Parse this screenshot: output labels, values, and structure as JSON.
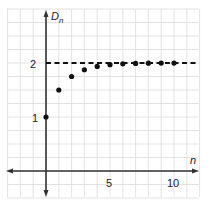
{
  "chart_data": {
    "type": "scatter",
    "title": "",
    "xlabel": "n",
    "ylabel": "D_n",
    "ylabel_main": "D",
    "ylabel_sub": "n",
    "x": [
      0,
      1,
      2,
      3,
      4,
      5,
      6,
      7,
      8,
      9,
      10
    ],
    "series": [
      {
        "name": "D_n",
        "values": [
          1,
          1.5,
          1.75,
          1.875,
          1.9375,
          1.96875,
          1.984,
          1.992,
          1.996,
          1.998,
          1.999
        ]
      }
    ],
    "asymptote": {
      "y": 2,
      "style": "dashed"
    },
    "x_ticks": [
      5,
      10
    ],
    "y_ticks": [
      1,
      2
    ],
    "x_tick_labels": [
      "5",
      "10"
    ],
    "y_tick_labels": [
      "1",
      "2"
    ],
    "xlim": [
      -3,
      12
    ],
    "ylim": [
      -0.5,
      3
    ],
    "grid": true,
    "legend": null
  }
}
